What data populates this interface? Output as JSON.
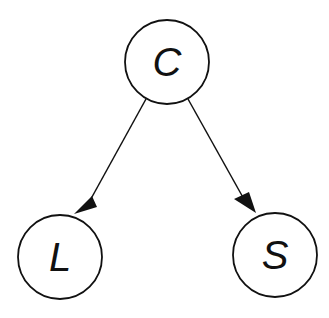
{
  "diagram": {
    "type": "directed-graph",
    "nodes": [
      {
        "id": "C",
        "label": "C",
        "cx": 167,
        "cy": 62
      },
      {
        "id": "L",
        "label": "L",
        "cx": 60,
        "cy": 257
      },
      {
        "id": "S",
        "label": "S",
        "cx": 275,
        "cy": 255
      }
    ],
    "edges": [
      {
        "from": "C",
        "to": "L"
      },
      {
        "from": "C",
        "to": "S"
      }
    ],
    "colors": {
      "stroke": "#111111",
      "fill": "#ffffff"
    }
  }
}
